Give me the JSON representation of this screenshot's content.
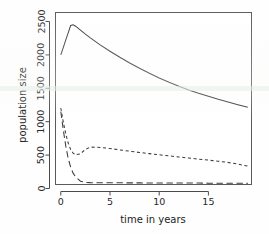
{
  "chart_data": {
    "type": "line",
    "title": "",
    "xlabel": "time in years",
    "ylabel": "population size",
    "xlim": [
      -0.6,
      19.6
    ],
    "ylim": [
      -60,
      2620
    ],
    "xticks": [
      0,
      5,
      10,
      15
    ],
    "yticks": [
      0,
      500,
      1000,
      1500,
      2000,
      2500
    ],
    "xticklabels": [
      "0",
      "5",
      "10",
      "15"
    ],
    "yticklabels": [
      "0",
      "500",
      "1000",
      "1500",
      "2000",
      "2500"
    ],
    "grid": false,
    "legend": "none",
    "frame": "box",
    "x": [
      0,
      0.25,
      0.5,
      0.75,
      1,
      1.25,
      1.5,
      2,
      2.5,
      3,
      4,
      5,
      6,
      7,
      8,
      9,
      10,
      11,
      12,
      13,
      14,
      15,
      16,
      17,
      18,
      19
    ],
    "series": [
      {
        "name": "solid-line",
        "style": "solid",
        "color": "#3c3c3c",
        "values": [
          2000,
          2110,
          2220,
          2330,
          2440,
          2450,
          2430,
          2370,
          2310,
          2255,
          2150,
          2055,
          1965,
          1880,
          1800,
          1725,
          1655,
          1590,
          1530,
          1475,
          1425,
          1380,
          1335,
          1295,
          1255,
          1215
        ]
      },
      {
        "name": "short-dashed-line",
        "style": "dotted",
        "color": "#3c3c3c",
        "values": [
          1205,
          1000,
          820,
          680,
          585,
          530,
          505,
          520,
          585,
          620,
          615,
          598,
          578,
          558,
          540,
          522,
          505,
          488,
          472,
          456,
          440,
          425,
          408,
          390,
          365,
          335
        ]
      },
      {
        "name": "long-dashed-line",
        "style": "dashed",
        "color": "#3c3c3c",
        "values": [
          1150,
          880,
          640,
          450,
          320,
          230,
          175,
          110,
          92,
          88,
          86,
          85,
          85,
          84,
          84,
          83,
          83,
          82,
          82,
          81,
          81,
          80,
          80,
          79,
          78,
          77
        ]
      }
    ]
  }
}
